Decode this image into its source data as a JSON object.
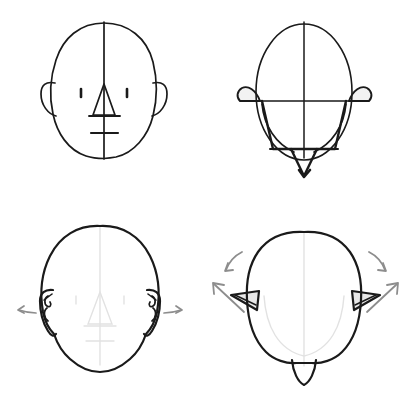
{
  "document": {
    "title": "Head Construction Reference — Ear Placement",
    "background_color": "#ffffff",
    "width": 407,
    "height": 400,
    "medium": "line drawing / pencil sketch",
    "subject": "human head construction with ear placement guides"
  },
  "colors": {
    "ink_dark": "#1a1a1a",
    "ink_outline": "#222222",
    "guide_line": "#2b2b2b",
    "guide_faint": "#e2e2e2",
    "arrow_gray": "#8d8d8d",
    "paper": "#ffffff"
  },
  "panels": [
    {
      "id": "front-schematic",
      "name": "front-view-schematic",
      "position": "top-left",
      "view": "front",
      "stage": "schematic construction",
      "features": [
        "oval cranium",
        "vertical center line",
        "left ear C-curve",
        "right ear C-curve",
        "left eye dash",
        "right eye dash",
        "triangular nose",
        "nose base line",
        "mouth line"
      ]
    },
    {
      "id": "top-schematic",
      "name": "top-view-schematic",
      "position": "top-right",
      "view": "top-down",
      "stage": "schematic construction",
      "features": [
        "oval skull seen from above",
        "vertical center line",
        "horizontal ear line",
        "left ear wedge",
        "right ear wedge",
        "face plane trapezoid",
        "nose wedge pointing down"
      ]
    },
    {
      "id": "front-refined",
      "name": "front-view-refined",
      "position": "bottom-left",
      "view": "front",
      "stage": "refined outline",
      "features": [
        "refined head contour",
        "faint center guide",
        "faint eye line",
        "faint nose guide",
        "faint mouth guide",
        "detailed left ear",
        "detailed right ear",
        "left pointer arrow",
        "right pointer arrow"
      ]
    },
    {
      "id": "top-refined",
      "name": "top-view-refined",
      "position": "bottom-right",
      "view": "top-down",
      "stage": "refined outline",
      "features": [
        "refined skull contour from above",
        "faint center guide",
        "left triangular ear",
        "right triangular ear",
        "nose point at bottom",
        "left curved arrow",
        "left straight arrow",
        "right curved arrow",
        "right straight arrow"
      ]
    }
  ],
  "annotations": {
    "arrows": [
      {
        "id": "arrow-front-left",
        "panel": "front-refined",
        "direction": "left",
        "style": "curved-tail"
      },
      {
        "id": "arrow-front-right",
        "panel": "front-refined",
        "direction": "right",
        "style": "curved-tail"
      },
      {
        "id": "arrow-top-left-curved",
        "panel": "top-refined",
        "direction": "down-left",
        "style": "curved"
      },
      {
        "id": "arrow-top-left-straight",
        "panel": "top-refined",
        "direction": "up-left",
        "style": "straight"
      },
      {
        "id": "arrow-top-right-curved",
        "panel": "top-refined",
        "direction": "down-right",
        "style": "curved"
      },
      {
        "id": "arrow-top-right-straight",
        "panel": "top-refined",
        "direction": "up-right",
        "style": "straight"
      }
    ]
  }
}
